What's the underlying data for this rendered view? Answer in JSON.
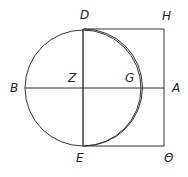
{
  "diagram": {
    "labels": {
      "D": {
        "text": "D",
        "x": 80,
        "y": 9
      },
      "H": {
        "text": "H",
        "x": 162,
        "y": 10
      },
      "Z": {
        "text": "Z",
        "x": 68,
        "y": 72
      },
      "G": {
        "text": "G",
        "x": 125,
        "y": 72
      },
      "B": {
        "text": "B",
        "x": 10,
        "y": 82
      },
      "A": {
        "text": "A",
        "x": 172,
        "y": 82
      },
      "E": {
        "text": "E",
        "x": 76,
        "y": 152
      },
      "Theta": {
        "text": "Θ",
        "x": 164,
        "y": 152
      }
    },
    "circle": {
      "cx": 83,
      "cy": 88,
      "r": 58
    },
    "stroke": "#333333"
  }
}
